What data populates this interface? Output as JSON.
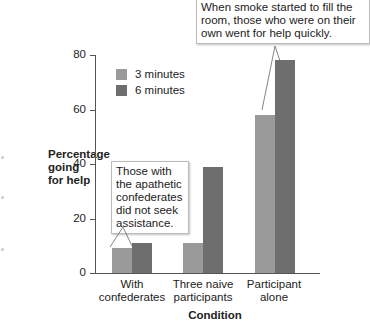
{
  "chart_data": {
    "type": "bar",
    "title": "",
    "xlabel": "Condition",
    "ylabel": "Percentage going for help",
    "ylabel_lines": [
      "Percentage",
      "going",
      "for help"
    ],
    "ylim": [
      0,
      80
    ],
    "yticks": [
      0,
      20,
      40,
      60,
      80
    ],
    "categories": [
      "With confederates",
      "Three naive participants",
      "Participant alone"
    ],
    "category_lines": [
      [
        "With",
        "confederates"
      ],
      [
        "Three naive",
        "participants"
      ],
      [
        "Participant",
        "alone"
      ]
    ],
    "series": [
      {
        "name": "3 minutes",
        "color": "#9a9a9a",
        "values": [
          9,
          11,
          58
        ]
      },
      {
        "name": "6 minutes",
        "color": "#6e6e6e",
        "values": [
          11,
          39,
          78
        ]
      }
    ],
    "legend_position": "upper-left inside",
    "grid": false,
    "annotations": [
      {
        "text": "Those with the apathetic confederates did not seek assistance.",
        "lines": [
          "Those with",
          "the apathetic",
          "confederates",
          "did not seek",
          "assistance."
        ],
        "target": "With confederates"
      },
      {
        "text": "When smoke started to fill the room, those who were on their own went for help quickly.",
        "lines": [
          "When smoke started to fill the",
          "room, those who were on their",
          "own went for help quickly."
        ],
        "target": "Participant alone"
      }
    ]
  }
}
